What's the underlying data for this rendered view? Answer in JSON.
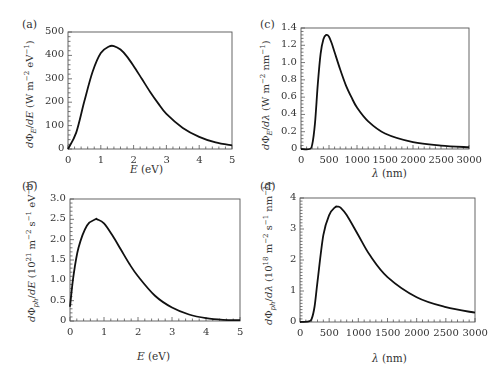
{
  "chart_data": [
    {
      "id": "a",
      "type": "line",
      "panel_label": "(a)",
      "title": "",
      "xlabel": "E (eV)",
      "ylabel": "dΦ_E/dE (W m^-2 eV^-1)",
      "xlim": [
        0,
        5
      ],
      "ylim": [
        0,
        500
      ],
      "xticks": [
        0,
        1,
        2,
        3,
        4,
        5
      ],
      "yticks": [
        0,
        100,
        200,
        300,
        400,
        500
      ],
      "grid": false,
      "x": [
        0,
        0.25,
        0.5,
        0.75,
        1.0,
        1.25,
        1.4,
        1.6,
        1.8,
        2.0,
        2.25,
        2.5,
        2.75,
        3.0,
        3.5,
        4.0,
        4.5,
        5.0
      ],
      "y": [
        0,
        70,
        205,
        330,
        410,
        438,
        440,
        425,
        395,
        355,
        300,
        245,
        195,
        150,
        90,
        52,
        28,
        15
      ]
    },
    {
      "id": "b",
      "type": "line",
      "panel_label": "(b)",
      "title": "",
      "xlabel": "E (eV)",
      "ylabel": "dΦ_ph/dE (10^21 m^-2 s^-1 eV^-1)",
      "xlim": [
        0,
        5
      ],
      "ylim": [
        0,
        3.0
      ],
      "xticks": [
        0,
        1,
        2,
        3,
        4,
        5
      ],
      "yticks": [
        0,
        0.5,
        1.0,
        1.5,
        2.0,
        2.5,
        3.0
      ],
      "grid": false,
      "x": [
        0,
        0.1,
        0.25,
        0.5,
        0.75,
        0.8,
        1.0,
        1.25,
        1.5,
        1.75,
        2.0,
        2.5,
        3.0,
        3.5,
        4.0,
        4.5,
        5.0
      ],
      "y": [
        0.35,
        1.1,
        1.8,
        2.35,
        2.5,
        2.5,
        2.4,
        2.1,
        1.75,
        1.4,
        1.1,
        0.62,
        0.33,
        0.16,
        0.07,
        0.03,
        0.02
      ]
    },
    {
      "id": "c",
      "type": "line",
      "panel_label": "(c)",
      "title": "",
      "xlabel": "λ (nm)",
      "ylabel": "dΦ_E/dλ (W m^-2 nm^-1)",
      "xlim": [
        0,
        3000
      ],
      "ylim": [
        0,
        1.4
      ],
      "xticks": [
        0,
        500,
        1000,
        1500,
        2000,
        2500,
        3000
      ],
      "yticks": [
        0,
        0.2,
        0.4,
        0.6,
        0.8,
        1.0,
        1.2,
        1.4
      ],
      "grid": false,
      "x": [
        0,
        150,
        200,
        250,
        300,
        350,
        400,
        450,
        500,
        550,
        600,
        700,
        800,
        900,
        1000,
        1200,
        1500,
        2000,
        2500,
        3000
      ],
      "y": [
        0,
        0,
        0.05,
        0.3,
        0.75,
        1.1,
        1.27,
        1.32,
        1.3,
        1.22,
        1.12,
        0.92,
        0.74,
        0.6,
        0.48,
        0.32,
        0.18,
        0.08,
        0.04,
        0.02
      ]
    },
    {
      "id": "d",
      "type": "line",
      "panel_label": "(d)",
      "title": "",
      "xlabel": "λ (nm)",
      "ylabel": "dΦ_ph/dλ (10^18 m^-2 s^-1 nm^-1)",
      "xlim": [
        0,
        3000
      ],
      "ylim": [
        0,
        4
      ],
      "xticks": [
        0,
        500,
        1000,
        1500,
        2000,
        2500,
        3000
      ],
      "yticks": [
        0,
        1,
        2,
        3,
        4
      ],
      "grid": false,
      "x": [
        0,
        150,
        200,
        250,
        300,
        400,
        500,
        600,
        650,
        700,
        800,
        1000,
        1200,
        1500,
        2000,
        2500,
        3000
      ],
      "y": [
        0,
        0.02,
        0.1,
        0.5,
        1.3,
        2.8,
        3.45,
        3.7,
        3.72,
        3.68,
        3.45,
        2.8,
        2.15,
        1.45,
        0.8,
        0.48,
        0.3
      ]
    }
  ],
  "panels": {
    "a": {
      "tag": "(a)",
      "x_tick_labels": [
        "0",
        "1",
        "2",
        "3",
        "4",
        "5"
      ],
      "y_tick_labels": [
        "0",
        "100",
        "200",
        "300",
        "400",
        "500"
      ]
    },
    "b": {
      "tag": "(b)",
      "x_tick_labels": [
        "0",
        "1",
        "2",
        "3",
        "4",
        "5"
      ],
      "y_tick_labels": [
        "0",
        "0.5",
        "1.0",
        "1.5",
        "2.0",
        "2.5",
        "3.0"
      ]
    },
    "c": {
      "tag": "(c)",
      "x_tick_labels": [
        "0",
        "500",
        "1000",
        "1500",
        "2000",
        "2500",
        "3000"
      ],
      "y_tick_labels": [
        "0",
        "0.2",
        "0.4",
        "0.6",
        "0.8",
        "1.0",
        "1.2",
        "1.4"
      ]
    },
    "d": {
      "tag": "(d)",
      "x_tick_labels": [
        "0",
        "500",
        "1000",
        "1500",
        "2000",
        "2500",
        "3000"
      ],
      "y_tick_labels": [
        "0",
        "1",
        "2",
        "3",
        "4"
      ]
    }
  },
  "colors": {
    "line": "#111111",
    "axis": "#555555",
    "text": "#333333"
  }
}
